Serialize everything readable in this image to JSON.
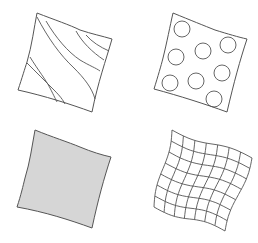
{
  "figure": {
    "colors": {
      "stroke": "#555555",
      "fill": "#d6d6d6",
      "background": "#ffffff"
    },
    "swatches": [
      {
        "position": "top-left",
        "pattern": "diagonal-stripes"
      },
      {
        "position": "top-right",
        "pattern": "polka-dots",
        "dot_count": 8
      },
      {
        "position": "bottom-left",
        "pattern": "solid-gray-fill"
      },
      {
        "position": "bottom-right",
        "pattern": "grid-check",
        "columns": 7,
        "rows": 7
      }
    ]
  }
}
